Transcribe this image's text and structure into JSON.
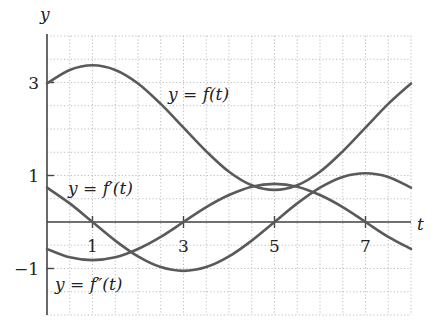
{
  "chart_data": {
    "type": "line",
    "title": "",
    "xlabel": "t",
    "ylabel": "y",
    "xlim": [
      0,
      8
    ],
    "ylim": [
      -2,
      4
    ],
    "grid": true,
    "grid_step": 0.5,
    "x_ticks": [
      1,
      3,
      5,
      7
    ],
    "x_tick_labels": [
      "1",
      "3",
      "5",
      "7"
    ],
    "y_ticks": [
      3,
      1,
      -1
    ],
    "y_tick_labels": [
      "3",
      "1",
      "−1"
    ],
    "series": [
      {
        "name": "y = f(t)",
        "x": [
          0,
          0.5,
          1,
          1.5,
          2,
          2.5,
          3,
          3.5,
          4,
          4.5,
          5,
          5.5,
          6,
          6.5,
          7,
          7.5,
          8
        ],
        "values": [
          2.98,
          3.27,
          3.37,
          3.27,
          2.98,
          2.54,
          2.03,
          1.52,
          1.08,
          0.79,
          0.69,
          0.79,
          1.08,
          1.52,
          2.03,
          2.54,
          2.98
        ],
        "label_pos": {
          "t": 4.3,
          "y": 2.6
        }
      },
      {
        "name": "y = f′(t)",
        "x": [
          0,
          0.5,
          1,
          1.5,
          2,
          2.5,
          3,
          3.5,
          4,
          4.5,
          5,
          5.5,
          6,
          6.5,
          7,
          7.5,
          8
        ],
        "values": [
          0.74,
          0.4,
          0,
          -0.4,
          -0.74,
          -0.97,
          -1.05,
          -0.97,
          -0.74,
          -0.4,
          0,
          0.4,
          0.74,
          0.97,
          1.05,
          0.97,
          0.74
        ],
        "label_pos": {
          "t": 0.45,
          "y": 0.62
        }
      },
      {
        "name": "y = f″(t)",
        "x": [
          0,
          0.5,
          1,
          1.5,
          2,
          2.5,
          3,
          3.5,
          4,
          4.5,
          5,
          5.5,
          6,
          6.5,
          7,
          7.5,
          8
        ],
        "values": [
          -0.58,
          -0.76,
          -0.82,
          -0.76,
          -0.58,
          -0.32,
          0,
          0.32,
          0.58,
          0.76,
          0.82,
          0.76,
          0.58,
          0.32,
          0,
          -0.32,
          -0.58
        ],
        "label_pos": {
          "t": 0.18,
          "y": -1.45
        }
      }
    ]
  },
  "labels": {
    "y_axis": "y",
    "t_axis": "t",
    "f_eq": "y = ",
    "f_fn": "f(t)",
    "fp_eq": "y = ",
    "fp_fn": "f′(t)",
    "fpp_eq": "y = ",
    "fpp_fn": "f″(t)"
  },
  "colors": {
    "curve": "#5a5a5a",
    "axis": "#444444",
    "grid": "#bdbdbd"
  }
}
